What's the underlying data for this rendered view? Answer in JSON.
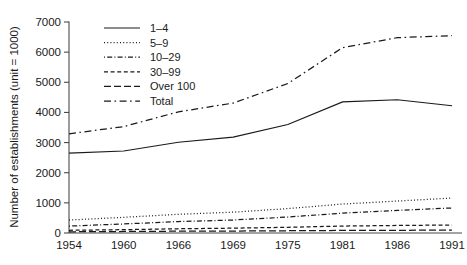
{
  "figure": {
    "name": "number-of-establishments-by-size-class-line-chart",
    "background": "#ffffff",
    "foreground": "#1a1a1a"
  },
  "axes": {
    "y_title": "Number of establishments (unit = 1000)",
    "x_title": "",
    "y_ticks": [
      "0",
      "1000",
      "2000",
      "3000",
      "4000",
      "5000",
      "6000",
      "7000"
    ],
    "x_ticks": [
      "1954",
      "1960",
      "1966",
      "1969",
      "1975",
      "1981",
      "1986",
      "1991"
    ]
  },
  "legend": {
    "position": "top-left-inside",
    "items": [
      {
        "label": "1–4",
        "dash": "none",
        "key": "s1_4"
      },
      {
        "label": "5–9",
        "dash": "1,2.2",
        "key": "s5_9"
      },
      {
        "label": "10–29",
        "dash": "1,2.2,5,2.2",
        "key": "s10_29"
      },
      {
        "label": "30–99",
        "dash": "4,2.6",
        "key": "s30_99"
      },
      {
        "label": "Over 100",
        "dash": "7,3",
        "key": "sover100"
      },
      {
        "label": "Total",
        "dash": "7,3.5,1.6,3.5",
        "key": "stotal"
      }
    ]
  },
  "chart_data": {
    "type": "line",
    "title": "",
    "subtitle": "",
    "xlabel": "",
    "ylabel": "Number of establishments (unit = 1000)",
    "x": [
      "1954",
      "1960",
      "1966",
      "1969",
      "1975",
      "1981",
      "1986",
      "1991"
    ],
    "xlim_categorical": true,
    "ylim": [
      0,
      7000
    ],
    "ytick_step": 1000,
    "grid": false,
    "unit_note": "unit = 1000",
    "legend_position": "top-left-inside",
    "series": [
      {
        "name": "1–4",
        "key": "s1_4",
        "dash": "none",
        "values": [
          2650,
          2720,
          3010,
          3180,
          3600,
          4350,
          4420,
          4220
        ]
      },
      {
        "name": "5–9",
        "key": "s5_9",
        "dash": "1,2.2",
        "values": [
          430,
          520,
          620,
          690,
          810,
          960,
          1060,
          1160
        ]
      },
      {
        "name": "10–29",
        "key": "s10_29",
        "dash": "1,2.2,5,2.2",
        "values": [
          230,
          300,
          380,
          430,
          530,
          660,
          750,
          830
        ]
      },
      {
        "name": "30–99",
        "key": "s30_99",
        "dash": "4,2.6",
        "values": [
          90,
          110,
          140,
          160,
          190,
          230,
          250,
          265
        ]
      },
      {
        "name": "Over 100",
        "key": "sover100",
        "dash": "7,3",
        "values": [
          40,
          50,
          60,
          65,
          75,
          85,
          90,
          95
        ]
      },
      {
        "name": "Total",
        "key": "stotal",
        "dash": "7,3.5,1.6,3.5",
        "values": [
          3290,
          3530,
          4020,
          4310,
          4960,
          6150,
          6480,
          6545
        ]
      }
    ]
  },
  "plot_geometry": {
    "left": 69,
    "right": 452,
    "top": 22,
    "bottom": 233
  }
}
